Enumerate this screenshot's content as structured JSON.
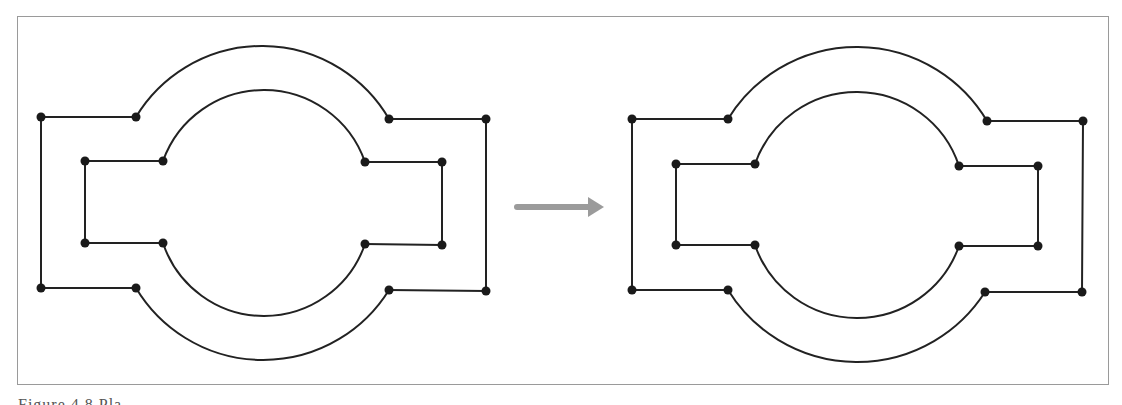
{
  "figure": {
    "caption": "Figure 4.8 Pla...",
    "caption_note": "caption mostly cropped at bottom edge",
    "colors": {
      "line": "#222222",
      "node": "#1a1a1a",
      "arrow": "#9b9b9b",
      "frame": "#9a9a9a"
    },
    "panels": [
      {
        "name": "before",
        "outer": {
          "top_left": [
            41,
            117
          ],
          "top_arc_start": [
            136,
            117
          ],
          "top_arc_end": [
            389,
            119
          ],
          "top_right": [
            486,
            119
          ],
          "bottom_left": [
            41,
            288
          ],
          "bottom_arc_start": [
            136,
            288
          ],
          "bottom_arc_end": [
            389,
            290
          ],
          "bottom_right": [
            486,
            291
          ],
          "arc_top_y": 46,
          "arc_bottom_y": 360
        },
        "inner": {
          "top_left": [
            85,
            161
          ],
          "top_arc_start": [
            163,
            161
          ],
          "top_arc_end": [
            365,
            162
          ],
          "top_right": [
            442,
            162
          ],
          "bottom_left": [
            85,
            243
          ],
          "bottom_arc_start": [
            163,
            243
          ],
          "bottom_arc_end": [
            365,
            244
          ],
          "bottom_right": [
            442,
            245
          ],
          "arc_top_y": 90,
          "arc_bottom_y": 316
        }
      },
      {
        "name": "after",
        "outer": {
          "top_left": [
            632,
            119
          ],
          "top_arc_start": [
            728,
            119
          ],
          "top_arc_end": [
            987,
            121
          ],
          "top_right": [
            1083,
            121
          ],
          "bottom_left": [
            632,
            290
          ],
          "bottom_arc_start": [
            728,
            290
          ],
          "bottom_arc_end": [
            985,
            292
          ],
          "bottom_right": [
            1082,
            292
          ],
          "arc_top_y": 47,
          "arc_bottom_y": 362
        },
        "inner": {
          "top_left": [
            676,
            164
          ],
          "top_arc_start": [
            755,
            164
          ],
          "top_arc_end": [
            959,
            166
          ],
          "top_right": [
            1038,
            166
          ],
          "bottom_left": [
            676,
            245
          ],
          "bottom_arc_start": [
            755,
            245
          ],
          "bottom_arc_end": [
            959,
            246
          ],
          "bottom_right": [
            1038,
            246
          ],
          "arc_top_y": 92,
          "arc_bottom_y": 318
        }
      }
    ],
    "arrow": {
      "from": [
        517,
        207
      ],
      "to": [
        604,
        207
      ],
      "direction": "right"
    }
  }
}
